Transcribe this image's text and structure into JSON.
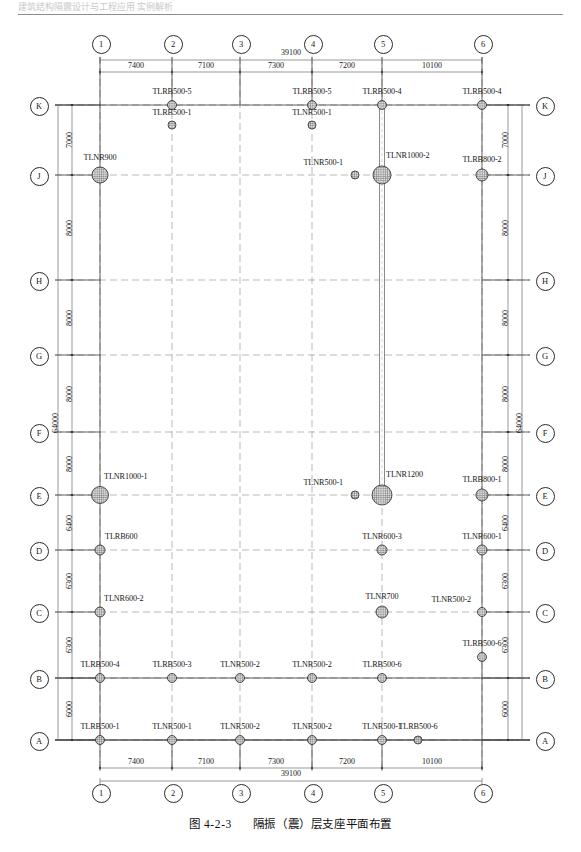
{
  "header": {
    "running_head": "建筑结构隔震设计与工程应用 实例解析"
  },
  "caption": {
    "figure_number": "图 4-2-3",
    "title": "隔振（震）层支座平面布置"
  },
  "grid": {
    "columns": [
      {
        "label": "1",
        "x": 100
      },
      {
        "label": "2",
        "x": 172
      },
      {
        "label": "3",
        "x": 240
      },
      {
        "label": "4",
        "x": 312
      },
      {
        "label": "5",
        "x": 382
      },
      {
        "label": "6",
        "x": 482
      }
    ],
    "rows": [
      {
        "label": "K",
        "y": 105
      },
      {
        "label": "J",
        "y": 175
      },
      {
        "label": "H",
        "y": 280
      },
      {
        "label": "G",
        "y": 355
      },
      {
        "label": "F",
        "y": 432
      },
      {
        "label": "E",
        "y": 495
      },
      {
        "label": "D",
        "y": 550
      },
      {
        "label": "C",
        "y": 612
      },
      {
        "label": "B",
        "y": 678
      },
      {
        "label": "A",
        "y": 740
      }
    ]
  },
  "dimensions": {
    "horizontal_top": {
      "total": "39100",
      "spans": [
        "7400",
        "7100",
        "7300",
        "7200",
        "10100"
      ]
    },
    "horizontal_bottom": {
      "total": "39100",
      "spans": [
        "7400",
        "7100",
        "7300",
        "7200",
        "10100"
      ]
    },
    "vertical_left": {
      "total": "64000",
      "spans": [
        "7000",
        "8000",
        "8000",
        "8000",
        "8000",
        "6400",
        "6300",
        "6300",
        "6000"
      ]
    },
    "vertical_right": {
      "total": "64000",
      "spans": [
        "7000",
        "8000",
        "8000",
        "8000",
        "8000",
        "6400",
        "6300",
        "6300",
        "6000"
      ]
    }
  },
  "bearings": [
    {
      "label": "TLRB500-5",
      "x": 172,
      "y": 105,
      "d": 9,
      "label_dx": 0,
      "label_dy": -14,
      "anchor": "center"
    },
    {
      "label": "TLRB500-1",
      "x": 172,
      "y": 125,
      "d": 8,
      "label_dx": 0,
      "label_dy": -13,
      "anchor": "center"
    },
    {
      "label": "TLRB500-5",
      "x": 312,
      "y": 105,
      "d": 9,
      "label_dx": 0,
      "label_dy": -14,
      "anchor": "center"
    },
    {
      "label": "TLNR500-1",
      "x": 312,
      "y": 125,
      "d": 8,
      "label_dx": 0,
      "label_dy": -13,
      "anchor": "center"
    },
    {
      "label": "TLRB500-4",
      "x": 382,
      "y": 105,
      "d": 9,
      "label_dx": 0,
      "label_dy": -14,
      "anchor": "center"
    },
    {
      "label": "TLRB500-4",
      "x": 482,
      "y": 105,
      "d": 9,
      "label_dx": 0,
      "label_dy": -14,
      "anchor": "center"
    },
    {
      "label": "TLNR900",
      "x": 100,
      "y": 175,
      "d": 16,
      "label_dx": 0,
      "label_dy": -18,
      "anchor": "center"
    },
    {
      "label": "TLNR500-1",
      "x": 355,
      "y": 175,
      "d": 8,
      "label_dx": -12,
      "label_dy": -13,
      "anchor": "right"
    },
    {
      "label": "TLNR1000-2",
      "x": 382,
      "y": 175,
      "d": 18,
      "label_dx": 4,
      "label_dy": -20,
      "anchor": "left"
    },
    {
      "label": "TLRB800-2",
      "x": 482,
      "y": 175,
      "d": 12,
      "label_dx": 0,
      "label_dy": -16,
      "anchor": "center"
    },
    {
      "label": "TLNR1000-1",
      "x": 100,
      "y": 495,
      "d": 17,
      "label_dx": 4,
      "label_dy": -19,
      "anchor": "left"
    },
    {
      "label": "TLNR500-1",
      "x": 355,
      "y": 495,
      "d": 8,
      "label_dx": -12,
      "label_dy": -13,
      "anchor": "right"
    },
    {
      "label": "TLNR1200",
      "x": 382,
      "y": 495,
      "d": 20,
      "label_dx": 4,
      "label_dy": -21,
      "anchor": "left"
    },
    {
      "label": "TLRB800-1",
      "x": 482,
      "y": 495,
      "d": 12,
      "label_dx": 0,
      "label_dy": -16,
      "anchor": "center"
    },
    {
      "label": "TLRB600",
      "x": 100,
      "y": 550,
      "d": 10,
      "label_dx": 5,
      "label_dy": -14,
      "anchor": "left"
    },
    {
      "label": "TLNR600-3",
      "x": 382,
      "y": 550,
      "d": 10,
      "label_dx": 0,
      "label_dy": -14,
      "anchor": "center"
    },
    {
      "label": "TLNR600-1",
      "x": 482,
      "y": 550,
      "d": 10,
      "label_dx": 0,
      "label_dy": -14,
      "anchor": "center"
    },
    {
      "label": "TLNR600-2",
      "x": 100,
      "y": 612,
      "d": 10,
      "label_dx": 4,
      "label_dy": -14,
      "anchor": "left"
    },
    {
      "label": "TLNR700",
      "x": 382,
      "y": 612,
      "d": 12,
      "label_dx": 0,
      "label_dy": -16,
      "anchor": "center"
    },
    {
      "label": "TLNR500-2",
      "x": 482,
      "y": 612,
      "d": 9,
      "label_dx": -11,
      "label_dy": -13,
      "anchor": "right"
    },
    {
      "label": "TLRB500-4",
      "x": 100,
      "y": 678,
      "d": 9,
      "label_dx": 0,
      "label_dy": -14,
      "anchor": "center"
    },
    {
      "label": "TLRB500-3",
      "x": 172,
      "y": 678,
      "d": 9,
      "label_dx": 0,
      "label_dy": -14,
      "anchor": "center"
    },
    {
      "label": "TLNR500-2",
      "x": 240,
      "y": 678,
      "d": 9,
      "label_dx": 0,
      "label_dy": -14,
      "anchor": "center"
    },
    {
      "label": "TLNR500-2",
      "x": 312,
      "y": 678,
      "d": 9,
      "label_dx": 0,
      "label_dy": -14,
      "anchor": "center"
    },
    {
      "label": "TLRB500-6",
      "x": 382,
      "y": 678,
      "d": 9,
      "label_dx": 0,
      "label_dy": -14,
      "anchor": "center"
    },
    {
      "label": "TLRB500-6",
      "x": 482,
      "y": 657,
      "d": 9,
      "label_dx": 0,
      "label_dy": -14,
      "anchor": "center"
    },
    {
      "label": "TLRB500-1",
      "x": 100,
      "y": 740,
      "d": 9,
      "label_dx": 0,
      "label_dy": -14,
      "anchor": "center"
    },
    {
      "label": "TLNR500-1",
      "x": 172,
      "y": 740,
      "d": 9,
      "label_dx": 0,
      "label_dy": -14,
      "anchor": "center"
    },
    {
      "label": "TLNR500-2",
      "x": 240,
      "y": 740,
      "d": 9,
      "label_dx": 0,
      "label_dy": -14,
      "anchor": "center"
    },
    {
      "label": "TLNR500-2",
      "x": 312,
      "y": 740,
      "d": 9,
      "label_dx": 0,
      "label_dy": -14,
      "anchor": "center"
    },
    {
      "label": "TLNR500-1",
      "x": 382,
      "y": 740,
      "d": 9,
      "label_dx": 0,
      "label_dy": -14,
      "anchor": "center"
    },
    {
      "label": "TLRB500-6",
      "x": 418,
      "y": 740,
      "d": 8,
      "label_dx": 0,
      "label_dy": -14,
      "anchor": "center"
    }
  ],
  "colors": {
    "line": "#3a3a3a",
    "dashed": "#8a8a8a",
    "dimension": "#6e6e6e",
    "bearing_fill": "#9a9a9a",
    "bearing_stroke": "#2a2a2a",
    "rule": "#8d8d8d"
  },
  "shaft": {
    "x": 382,
    "top_y": 105,
    "bottom_y": 495,
    "width": 5
  }
}
